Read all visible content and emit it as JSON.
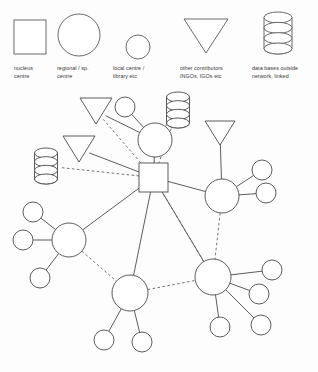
{
  "legend": {
    "items": [
      {
        "icon": "square-icon",
        "shape": "square",
        "line1": "nucleus",
        "line2": "centre"
      },
      {
        "icon": "large-circle-icon",
        "shape": "circle-large",
        "line1": "regional / sp.",
        "line2": "centre"
      },
      {
        "icon": "small-circle-icon",
        "shape": "circle-small",
        "line1": "local centre /",
        "line2": "library etc"
      },
      {
        "icon": "triangle-icon",
        "shape": "triangle-down",
        "line1": "other contributors",
        "line2": "INGOs, IGOs etc"
      },
      {
        "icon": "cylinder-icon",
        "shape": "cylinder",
        "line1": "data bases outside",
        "line2": "network, linked"
      }
    ]
  },
  "colors": {
    "stroke": "#4a4a4a",
    "legend_stroke": "#5a5a5a",
    "fill": "#ffffff",
    "background": "#fdfdfd",
    "text": "#3a3a3a"
  },
  "chart_data": {
    "type": "diagram",
    "layout": "node-link network",
    "nodes": [
      {
        "id": "nucleus",
        "name": "nucleus-centre",
        "type": "square",
        "x": 153.5,
        "y": 177.5,
        "size": 29
      },
      {
        "id": "r_top",
        "name": "regional-centre-top",
        "type": "circle-large",
        "x": 155,
        "y": 140,
        "r": 17
      },
      {
        "id": "r_right",
        "name": "regional-centre-right",
        "type": "circle-large",
        "x": 222,
        "y": 196,
        "r": 17
      },
      {
        "id": "r_left",
        "name": "regional-centre-left",
        "type": "circle-large",
        "x": 69,
        "y": 240,
        "r": 17
      },
      {
        "id": "r_bottom",
        "name": "regional-centre-bottom",
        "type": "circle-large",
        "x": 130,
        "y": 293,
        "r": 18
      },
      {
        "id": "r_bright",
        "name": "regional-centre-bottom-right",
        "type": "circle-large",
        "x": 213,
        "y": 277,
        "r": 18
      },
      {
        "id": "l_top",
        "name": "local-centre-top",
        "type": "circle-small",
        "x": 125,
        "y": 107,
        "r": 10
      },
      {
        "id": "l_r1",
        "name": "local-centre-right-upper",
        "type": "circle-small",
        "x": 262,
        "y": 170,
        "r": 10
      },
      {
        "id": "l_r2",
        "name": "local-centre-right-lower",
        "type": "circle-small",
        "x": 266,
        "y": 193,
        "r": 10
      },
      {
        "id": "l_l1",
        "name": "local-centre-left-upper",
        "type": "circle-small",
        "x": 33,
        "y": 212,
        "r": 10
      },
      {
        "id": "l_l2",
        "name": "local-centre-left-mid",
        "type": "circle-small",
        "x": 23,
        "y": 240,
        "r": 10
      },
      {
        "id": "l_l3",
        "name": "local-centre-left-lower",
        "type": "circle-small",
        "x": 40,
        "y": 278,
        "r": 10
      },
      {
        "id": "l_b1",
        "name": "local-centre-bottom-left",
        "type": "circle-small",
        "x": 104,
        "y": 340,
        "r": 10
      },
      {
        "id": "l_b2",
        "name": "local-centre-bottom-right",
        "type": "circle-small",
        "x": 142,
        "y": 342,
        "r": 10
      },
      {
        "id": "l_br1",
        "name": "local-centre-br-upper",
        "type": "circle-small",
        "x": 272,
        "y": 270,
        "r": 10
      },
      {
        "id": "l_br2",
        "name": "local-centre-br-mid",
        "type": "circle-small",
        "x": 259,
        "y": 294,
        "r": 10
      },
      {
        "id": "l_br3",
        "name": "local-centre-br-lower",
        "type": "circle-small",
        "x": 261,
        "y": 325,
        "r": 10
      },
      {
        "id": "l_br4",
        "name": "local-centre-br-bottom",
        "type": "circle-small",
        "x": 220,
        "y": 327,
        "r": 10
      },
      {
        "id": "t_1",
        "name": "contributor-upper-left",
        "type": "triangle-down",
        "x": 96,
        "y": 111,
        "w": 32,
        "h": 26
      },
      {
        "id": "t_2",
        "name": "contributor-mid-left",
        "type": "triangle-down",
        "x": 79,
        "y": 149,
        "w": 32,
        "h": 26
      },
      {
        "id": "t_3",
        "name": "contributor-right",
        "type": "triangle-down",
        "x": 220,
        "y": 133,
        "w": 30,
        "h": 24
      },
      {
        "id": "db_top",
        "name": "database-top",
        "type": "cylinder",
        "x": 178,
        "y": 110,
        "w": 23,
        "h": 36
      },
      {
        "id": "db_left",
        "name": "database-left",
        "type": "cylinder",
        "x": 46,
        "y": 166,
        "w": 23,
        "h": 36
      }
    ],
    "edges": [
      {
        "from": "nucleus",
        "to": "r_top",
        "style": "solid"
      },
      {
        "from": "nucleus",
        "to": "r_right",
        "style": "solid"
      },
      {
        "from": "nucleus",
        "to": "r_left",
        "style": "solid"
      },
      {
        "from": "nucleus",
        "to": "r_bottom",
        "style": "solid"
      },
      {
        "from": "nucleus",
        "to": "r_bright",
        "style": "solid"
      },
      {
        "from": "nucleus",
        "to": "t_2",
        "style": "solid"
      },
      {
        "from": "nucleus",
        "to": "t_1",
        "style": "dashed"
      },
      {
        "from": "nucleus",
        "to": "db_left",
        "style": "dashed"
      },
      {
        "from": "nucleus",
        "to": "db_top",
        "style": "dashed"
      },
      {
        "from": "nucleus",
        "to": "r_bright",
        "style": "dashed-alt"
      },
      {
        "from": "r_top",
        "to": "l_top",
        "style": "solid"
      },
      {
        "from": "r_top",
        "to": "t_1",
        "style": "solid"
      },
      {
        "from": "r_top",
        "to": "db_top",
        "style": "dashed"
      },
      {
        "from": "r_right",
        "to": "t_3",
        "style": "solid"
      },
      {
        "from": "r_right",
        "to": "l_r1",
        "style": "solid"
      },
      {
        "from": "r_right",
        "to": "l_r2",
        "style": "solid"
      },
      {
        "from": "r_right",
        "to": "r_bright",
        "style": "dashed"
      },
      {
        "from": "r_left",
        "to": "l_l1",
        "style": "solid"
      },
      {
        "from": "r_left",
        "to": "l_l2",
        "style": "solid"
      },
      {
        "from": "r_left",
        "to": "l_l3",
        "style": "solid"
      },
      {
        "from": "r_left",
        "to": "r_bottom",
        "style": "dashed"
      },
      {
        "from": "r_bottom",
        "to": "l_b1",
        "style": "solid"
      },
      {
        "from": "r_bottom",
        "to": "l_b2",
        "style": "solid"
      },
      {
        "from": "r_bottom",
        "to": "r_bright",
        "style": "dashed"
      },
      {
        "from": "r_bright",
        "to": "l_br1",
        "style": "solid"
      },
      {
        "from": "r_bright",
        "to": "l_br2",
        "style": "solid"
      },
      {
        "from": "r_bright",
        "to": "l_br3",
        "style": "solid"
      },
      {
        "from": "r_bright",
        "to": "l_br4",
        "style": "solid"
      }
    ]
  }
}
